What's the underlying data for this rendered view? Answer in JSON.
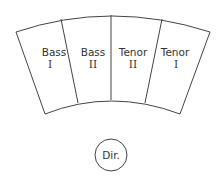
{
  "diagram": {
    "sections": [
      {
        "name": "Bass",
        "part": "I"
      },
      {
        "name": "Bass",
        "part": "II"
      },
      {
        "name": "Tenor",
        "part": "II"
      },
      {
        "name": "Tenor",
        "part": "I"
      }
    ],
    "director": {
      "label": "Dir."
    },
    "colors": {
      "stroke": "#444444",
      "text": "#333333",
      "background": "#ffffff"
    }
  }
}
